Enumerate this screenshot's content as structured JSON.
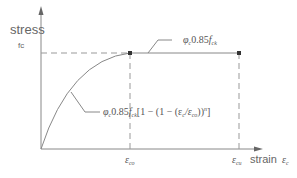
{
  "diagram": {
    "y_axis": {
      "label": "stress",
      "sublabel": "fc"
    },
    "x_axis": {
      "label": "strain",
      "symbol": "ε",
      "symbol_sub": "c"
    },
    "ticks": [
      {
        "symbol": "ε",
        "sub": "co"
      },
      {
        "symbol": "ε",
        "sub": "cu"
      }
    ],
    "annotations": {
      "plateau": {
        "phi": "φ",
        "phi_sub": "c",
        "text": "0.85",
        "f": "f",
        "f_sub": "ck"
      },
      "curve": {
        "phi": "φ",
        "phi_sub": "c",
        "text": "0.85",
        "f": "f",
        "f_sub": "ck",
        "bracket": "[1 − (1 − (ε",
        "eps_sub1": "c",
        "slash": "/ε",
        "eps_sub2": "co",
        "close": "))",
        "exp": "n",
        "end": "]"
      }
    },
    "colors": {
      "line": "#888888",
      "dash": "#999999",
      "dot": "#333333",
      "text": "#555555"
    }
  }
}
